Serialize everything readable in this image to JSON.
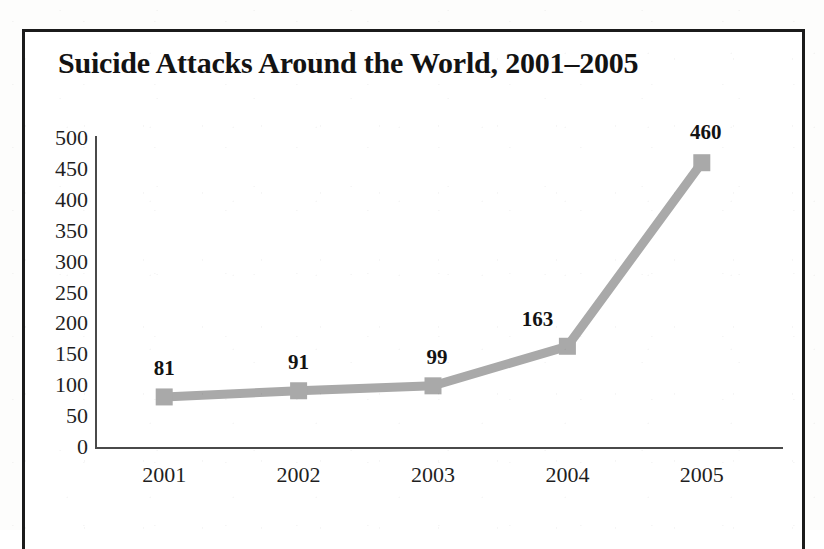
{
  "figure": {
    "title": "Suicide Attacks Around the World, 2001–2005",
    "frame_color": "#1b1b1b",
    "background_color": "#ffffff"
  },
  "chart_data": {
    "type": "line",
    "title": "Suicide Attacks Around the World, 2001–2005",
    "xlabel": "",
    "ylabel": "",
    "categories": [
      "2001",
      "2002",
      "2003",
      "2004",
      "2005"
    ],
    "values": [
      81,
      91,
      99,
      163,
      460
    ],
    "point_labels": [
      "81",
      "91",
      "99",
      "163",
      "460"
    ],
    "ylim": [
      0,
      500
    ],
    "ytick_step": 50,
    "yticks": [
      "500",
      "450",
      "400",
      "350",
      "300",
      "250",
      "200",
      "150",
      "100",
      "50",
      "0"
    ],
    "ytick_values": [
      500,
      450,
      400,
      350,
      300,
      250,
      200,
      150,
      100,
      50,
      0
    ],
    "xticks": [
      "2001",
      "2002",
      "2003",
      "2004",
      "2005"
    ],
    "grid": false,
    "legend": false,
    "legend_position": "none",
    "series_color": "#a9a9a9",
    "marker": "square",
    "marker_color": "#a9a9a9",
    "line_width": 9,
    "label_color": "#131313"
  },
  "axis": {
    "line_color": "#4a4a4a",
    "tick_label_color": "#1f1f1f"
  }
}
